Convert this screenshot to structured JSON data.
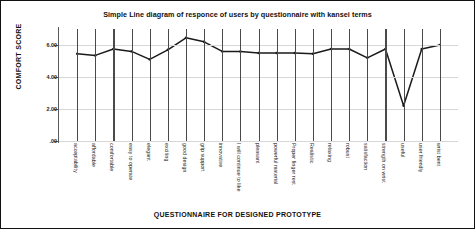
{
  "chart_data": {
    "type": "line",
    "title": "Simple Line diagram of responce of users by questionnaire with kansei terms",
    "xlabel": "QUESTIONNAIRE FOR DESIGNED PROTOTYPE",
    "ylabel": "COMFORT SCORE",
    "ylim": [
      0,
      7
    ],
    "ytick_labels": [
      ".00",
      "2.00",
      "4.00",
      "6.00"
    ],
    "ytick_values": [
      0,
      2,
      4,
      6
    ],
    "grid": "horizontal-and-vertical",
    "legend": "none",
    "line_color": "#1a1a1a",
    "categories": [
      "acceptability",
      "affordable",
      "comfortable",
      "easy to operate",
      "elegant",
      "exciting",
      "good design",
      "grip support",
      "innovative",
      "I will continue to like",
      "pleasant",
      "powerful material",
      "Proper finger rest",
      "Realistic",
      "relaxing",
      "robust",
      "satisfaction",
      "strength on wrist",
      "useful",
      "user friendly",
      "wrist bent"
    ],
    "values": [
      5.45,
      5.35,
      5.75,
      5.6,
      5.1,
      5.7,
      6.45,
      6.2,
      5.6,
      5.6,
      5.5,
      5.5,
      5.5,
      5.45,
      5.75,
      5.75,
      5.2,
      5.75,
      2.2,
      5.75,
      6.0
    ],
    "series": [
      {
        "name": "comfort score",
        "values": [
          5.45,
          5.35,
          5.75,
          5.6,
          5.1,
          5.7,
          6.45,
          6.2,
          5.6,
          5.6,
          5.5,
          5.5,
          5.5,
          5.45,
          5.75,
          5.75,
          5.2,
          5.75,
          2.2,
          5.75,
          6.0
        ]
      }
    ]
  }
}
